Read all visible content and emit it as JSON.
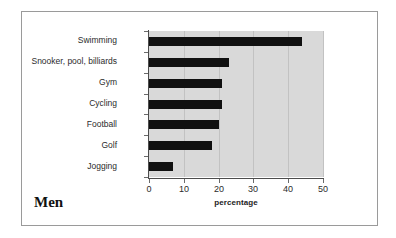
{
  "figure": {
    "title": "Men",
    "border_color": "#9a9a9a",
    "background": "#ffffff"
  },
  "chart_data": {
    "type": "bar",
    "orientation": "horizontal",
    "title": "Men",
    "xlabel": "percentage",
    "ylabel": "",
    "xlim": [
      0,
      50
    ],
    "xticks": [
      0,
      10,
      20,
      30,
      40,
      50
    ],
    "xtick_labels": [
      "0",
      "10",
      "20",
      "30",
      "40",
      "50"
    ],
    "grid": true,
    "grid_axis": "x",
    "legend": false,
    "plot_background": "#d9d9d9",
    "bar_color": "#111111",
    "categories": [
      "Swimming",
      "Snooker, pool, billiards",
      "Gym",
      "Cycling",
      "Football",
      "Golf",
      "Jogging"
    ],
    "values": [
      44,
      23,
      21,
      21,
      20,
      18,
      7
    ]
  }
}
